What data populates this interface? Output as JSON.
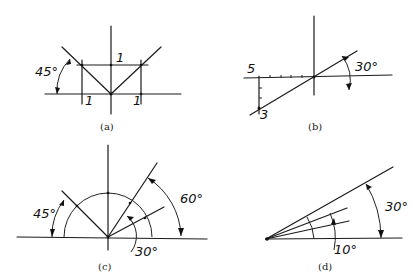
{
  "figure": {
    "panels": [
      {
        "id": "a",
        "caption": "(a)",
        "angle_label": "45°",
        "unit_labels": [
          "1",
          "1",
          "1"
        ]
      },
      {
        "id": "b",
        "caption": "(b)",
        "angle_label": "30°",
        "horizontal_label": "5",
        "vertical_label": "3"
      },
      {
        "id": "c",
        "caption": "(c)",
        "angle_labels": [
          "45°",
          "60°",
          "30°"
        ]
      },
      {
        "id": "d",
        "caption": "(d)",
        "angle_labels": [
          "30°",
          "10°"
        ]
      }
    ]
  }
}
